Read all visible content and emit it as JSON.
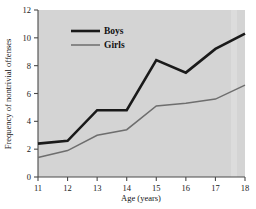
{
  "chart_data": {
    "type": "line",
    "title": "",
    "xlabel": "Age (years)",
    "ylabel": "Frequency of nontrivial offenses",
    "x": [
      11,
      12,
      13,
      14,
      15,
      16,
      17,
      18
    ],
    "xtick_labels": [
      "11",
      "12",
      "13",
      "14",
      "15",
      "16",
      "17",
      "18"
    ],
    "ytick_labels": [
      "0",
      "2",
      "4",
      "6",
      "8",
      "10",
      "12"
    ],
    "yticks": [
      0,
      2,
      4,
      6,
      8,
      10,
      12
    ],
    "xlim": [
      11,
      18
    ],
    "ylim": [
      0,
      12
    ],
    "grid": false,
    "legend_position": "upper-left-inside",
    "series": [
      {
        "name": "Boys",
        "color": "#1a1a1a",
        "width": 2.6,
        "values": [
          2.4,
          2.6,
          4.8,
          4.8,
          8.4,
          7.5,
          9.2,
          10.3
        ]
      },
      {
        "name": "Girls",
        "color": "#6e6e6e",
        "width": 1.5,
        "values": [
          1.4,
          1.9,
          3.0,
          3.4,
          5.1,
          5.3,
          5.6,
          6.6
        ]
      }
    ]
  },
  "style": {
    "plot_background": "#d4d4d4",
    "page_background": "#ffffff",
    "axis_color": "#4a4a4a",
    "band_color": "#dcdcdc"
  },
  "legend": {
    "entries": [
      {
        "label": "Boys"
      },
      {
        "label": "Girls"
      }
    ]
  },
  "axes": {
    "x_title": "Age (years)",
    "y_title": "Frequency of nontrivial offenses"
  }
}
